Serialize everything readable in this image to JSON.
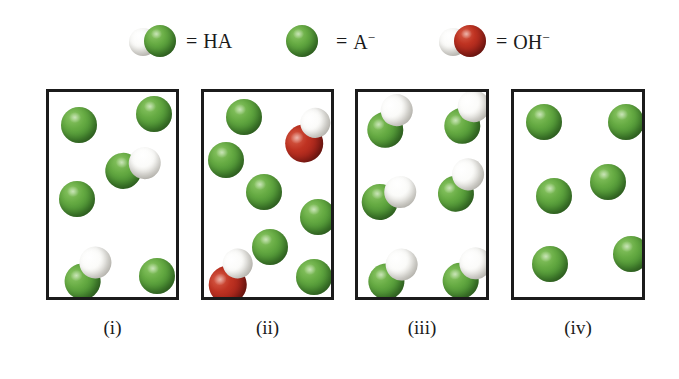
{
  "figure": {
    "title": "",
    "background": "#ffffff",
    "colors": {
      "green": "#4b9233",
      "white": "#f2f1ec",
      "red": "#a5231a",
      "box_border": "#1b1b1b",
      "text": "#1a1a1a"
    }
  },
  "legend": {
    "items": [
      {
        "key": "HA",
        "glyph": "hydrogen-green-pair-icon",
        "equals": "=",
        "label": "HA",
        "charge": "",
        "x": 128,
        "atoms": [
          {
            "type": "white",
            "cx": 15,
            "cy": 21,
            "r": 14
          },
          {
            "type": "green",
            "cx": 32,
            "cy": 20,
            "r": 16
          }
        ]
      },
      {
        "key": "A-",
        "glyph": "green-sphere-icon",
        "equals": "=",
        "label": "A",
        "charge": "−",
        "x": 278,
        "atoms": [
          {
            "type": "green",
            "cx": 24,
            "cy": 20,
            "r": 16
          }
        ]
      },
      {
        "key": "OH-",
        "glyph": "hydrogen-oxygen-pair-icon",
        "equals": "=",
        "label": "OH",
        "charge": "−",
        "x": 438,
        "atoms": [
          {
            "type": "white",
            "cx": 15,
            "cy": 21,
            "r": 14
          },
          {
            "type": "red",
            "cx": 32,
            "cy": 20,
            "r": 16
          }
        ]
      }
    ]
  },
  "panels": [
    {
      "id": "panel-i",
      "label": "(i)",
      "x": 46,
      "y": 89,
      "width": 133,
      "height": 211,
      "label_y": 318,
      "counts": {
        "HA": 2,
        "A-": 4,
        "OH-": 0
      },
      "particles": [
        {
          "species": "A-",
          "cx": 30,
          "cy": 33,
          "angle": 0
        },
        {
          "species": "A-",
          "cx": 105,
          "cy": 22,
          "angle": 0
        },
        {
          "species": "HA",
          "cx": 85,
          "cy": 75,
          "angle": 18
        },
        {
          "species": "A-",
          "cx": 28,
          "cy": 107,
          "angle": 0
        },
        {
          "species": "HA",
          "cx": 40,
          "cy": 180,
          "angle": -18
        },
        {
          "species": "A-",
          "cx": 108,
          "cy": 184,
          "angle": 0
        }
      ]
    },
    {
      "id": "panel-ii",
      "label": "(ii)",
      "x": 201,
      "y": 89,
      "width": 133,
      "height": 211,
      "label_y": 318,
      "counts": {
        "HA": 0,
        "A-": 6,
        "OH-": 2
      },
      "particles": [
        {
          "species": "A-",
          "cx": 40,
          "cy": 25,
          "angle": 0
        },
        {
          "species": "OH-",
          "cx": 105,
          "cy": 42,
          "angle": -22
        },
        {
          "species": "A-",
          "cx": 22,
          "cy": 68,
          "angle": 0
        },
        {
          "species": "A-",
          "cx": 60,
          "cy": 100,
          "angle": 0
        },
        {
          "species": "A-",
          "cx": 114,
          "cy": 125,
          "angle": 0
        },
        {
          "species": "A-",
          "cx": 66,
          "cy": 155,
          "angle": 0
        },
        {
          "species": "OH-",
          "cx": 28,
          "cy": 183,
          "angle": -25
        },
        {
          "species": "A-",
          "cx": 110,
          "cy": 185,
          "angle": 0
        }
      ]
    },
    {
      "id": "panel-iii",
      "label": "(iii)",
      "x": 355,
      "y": 89,
      "width": 134,
      "height": 211,
      "label_y": 318,
      "counts": {
        "HA": 6,
        "A-": 0,
        "OH-": 0
      },
      "particles": [
        {
          "species": "HA",
          "cx": 33,
          "cy": 28,
          "angle": -22
        },
        {
          "species": "HA",
          "cx": 110,
          "cy": 24,
          "angle": -22
        },
        {
          "species": "HA",
          "cx": 104,
          "cy": 92,
          "angle": -20
        },
        {
          "species": "HA",
          "cx": 32,
          "cy": 105,
          "angle": 12
        },
        {
          "species": "HA",
          "cx": 36,
          "cy": 181,
          "angle": -10
        },
        {
          "species": "HA",
          "cx": 110,
          "cy": 180,
          "angle": -12
        }
      ]
    },
    {
      "id": "panel-iv",
      "label": "(iv)",
      "x": 511,
      "y": 89,
      "width": 134,
      "height": 211,
      "label_y": 318,
      "counts": {
        "HA": 0,
        "A-": 6,
        "OH-": 0
      },
      "particles": [
        {
          "species": "A-",
          "cx": 30,
          "cy": 30,
          "angle": 0
        },
        {
          "species": "A-",
          "cx": 112,
          "cy": 30,
          "angle": 0
        },
        {
          "species": "A-",
          "cx": 94,
          "cy": 90,
          "angle": 0
        },
        {
          "species": "A-",
          "cx": 40,
          "cy": 104,
          "angle": 0
        },
        {
          "species": "A-",
          "cx": 36,
          "cy": 172,
          "angle": 0
        },
        {
          "species": "A-",
          "cx": 117,
          "cy": 162,
          "angle": 0
        }
      ]
    }
  ],
  "species_geometry": {
    "HA": {
      "atoms": [
        {
          "type": "green",
          "dx": -9,
          "dy": 7,
          "r": 18
        },
        {
          "type": "white",
          "dx": 9,
          "dy": -7,
          "r": 16
        }
      ]
    },
    "A-": {
      "atoms": [
        {
          "type": "green",
          "dx": 0,
          "dy": 0,
          "r": 18
        }
      ]
    },
    "OH-": {
      "atoms": [
        {
          "type": "red",
          "dx": -8,
          "dy": 7,
          "r": 19
        },
        {
          "type": "white",
          "dx": 10,
          "dy": -8,
          "r": 15
        }
      ]
    }
  }
}
